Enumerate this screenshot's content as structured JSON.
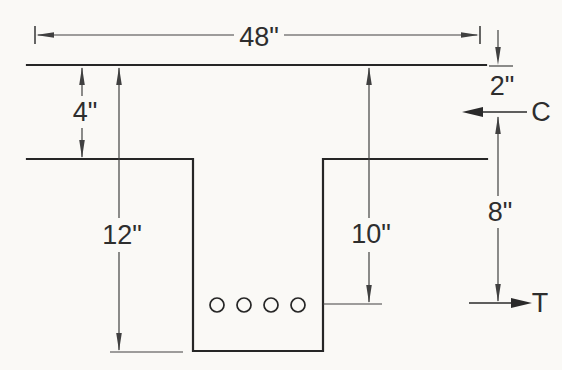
{
  "figure": {
    "labels": {
      "flange_width": "48\"",
      "flange_thickness": "4\"",
      "overall_depth": "12\"",
      "effective_depth": "10\"",
      "compression_offset": "2\"",
      "moment_arm": "8\"",
      "compression_force": "C",
      "tension_force": "T"
    },
    "rebar_count": 4,
    "colors": {
      "background": "#faf9f6",
      "outline": "#262626",
      "dimension_line": "#404040",
      "text": "#2e2e2e"
    }
  }
}
